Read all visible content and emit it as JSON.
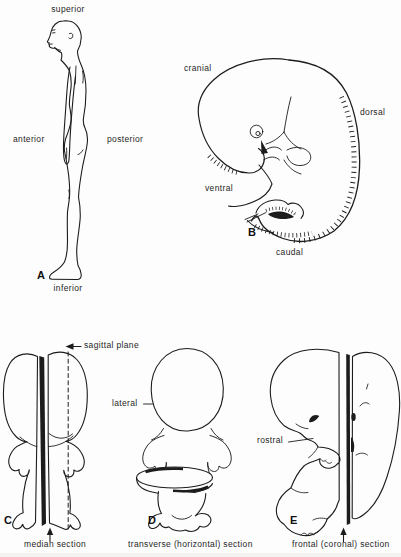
{
  "palette": {
    "background": "#fdfdfd",
    "ink": "#1c1c1c"
  },
  "panels": {
    "adult": {
      "letter": "A",
      "label_superior": "superior",
      "label_anterior": "anterior",
      "label_posterior": "posterior",
      "label_inferior": "inferior"
    },
    "embryo": {
      "letter": "B",
      "label_cranial": "cranial",
      "label_dorsal": "dorsal",
      "label_ventral": "ventral",
      "label_caudal": "caudal"
    },
    "median": {
      "letter": "C",
      "plane_label": "sagittal plane",
      "caption": "median section"
    },
    "transverse": {
      "letter": "D",
      "side_label": "lateral",
      "caption": "transverse (horizontal) section"
    },
    "frontal": {
      "letter": "E",
      "side_label": "rostral",
      "caption": "frontal (coronal) section"
    }
  }
}
